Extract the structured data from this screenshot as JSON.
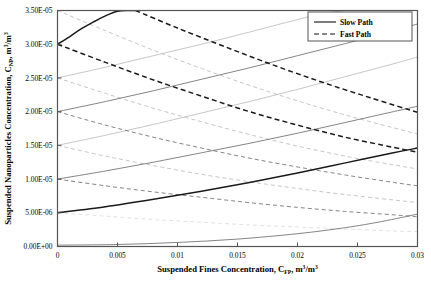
{
  "chart_data": {
    "type": "line",
    "title": "",
    "xlabel": "Suspended Fines Concentration, CFP, m3/m3",
    "ylabel": "Suspended Nanoparticles Concentration, CNP, m3/m3",
    "xlabel_parts": {
      "main": "Suspended Fines Concentration, C",
      "sub1": "FP",
      "mid": ", m",
      "sup1": "3",
      "mid2": "/m",
      "sup2": "3"
    },
    "ylabel_parts": {
      "main": "Suspended Nanoparticles Concentration, C",
      "sub1": "NP",
      "mid": ", m",
      "sup1": "3",
      "mid2": "/m",
      "sup2": "3"
    },
    "xlim": [
      0,
      0.03
    ],
    "ylim": [
      0,
      3.5e-05
    ],
    "grid": false,
    "xticks": [
      0,
      0.005,
      0.01,
      0.015,
      0.02,
      0.025,
      0.03
    ],
    "xtick_labels": [
      "0",
      "0.005",
      "0.01",
      "0.015",
      "0.02",
      "0.025",
      "0.03"
    ],
    "yticks": [
      0,
      5e-06,
      1e-05,
      1.5e-05,
      2e-05,
      2.5e-05,
      3e-05,
      3.5e-05
    ],
    "ytick_labels": [
      "0.00E+00",
      "5.00E-06",
      "1.00E-05",
      "1.50E-05",
      "2.00E-05",
      "2.50E-05",
      "3.00E-05",
      "3.50E-05"
    ],
    "legend": {
      "position": "top-right",
      "entries": [
        {
          "label": "Slow Path",
          "style": "solid"
        },
        {
          "label": "Fast Path",
          "style": "dashed"
        }
      ]
    },
    "colors": {
      "emphasis": "#1a1a1a",
      "mid": "#6e6e6e",
      "light": "#b8b8b8",
      "faint": "#d8d8d8",
      "axis": "#555555"
    },
    "series": [
      {
        "name": "slow-path-1",
        "style": "solid",
        "weight": "emphasis",
        "points": [
          [
            0,
            3e-05
          ],
          [
            0.001,
            3.11e-05
          ],
          [
            0.002,
            3.23e-05
          ],
          [
            0.003,
            3.33e-05
          ],
          [
            0.004,
            3.42e-05
          ],
          [
            0.005,
            3.49e-05
          ],
          [
            0.006,
            3.5e-05
          ],
          [
            0.0065,
            3.5e-05
          ]
        ]
      },
      {
        "name": "fast-path-1",
        "style": "dashed",
        "weight": "emphasis",
        "points": [
          [
            0.0065,
            3.5e-05
          ],
          [
            0.01,
            3.24e-05
          ],
          [
            0.014,
            2.96e-05
          ],
          [
            0.018,
            2.69e-05
          ],
          [
            0.022,
            2.44e-05
          ],
          [
            0.026,
            2.21e-05
          ],
          [
            0.03,
            1.99e-05
          ]
        ]
      },
      {
        "name": "fast-path-2",
        "style": "dashed",
        "weight": "emphasis",
        "points": [
          [
            0,
            3e-05
          ],
          [
            0.004,
            2.73e-05
          ],
          [
            0.008,
            2.47e-05
          ],
          [
            0.012,
            2.23e-05
          ],
          [
            0.016,
            2e-05
          ],
          [
            0.02,
            1.8e-05
          ],
          [
            0.024,
            1.62e-05
          ],
          [
            0.028,
            1.47e-05
          ],
          [
            0.03,
            1.4e-05
          ]
        ]
      },
      {
        "name": "slow-path-2",
        "style": "solid",
        "weight": "mid",
        "points": [
          [
            0,
            2e-05
          ],
          [
            0.004,
            2.15e-05
          ],
          [
            0.008,
            2.31e-05
          ],
          [
            0.012,
            2.48e-05
          ],
          [
            0.016,
            2.65e-05
          ],
          [
            0.02,
            2.83e-05
          ],
          [
            0.024,
            3.01e-05
          ],
          [
            0.028,
            3.2e-05
          ],
          [
            0.03,
            3.3e-05
          ]
        ]
      },
      {
        "name": "fast-path-3",
        "style": "dashed",
        "weight": "mid",
        "points": [
          [
            0,
            2e-05
          ],
          [
            0.004,
            1.8e-05
          ],
          [
            0.008,
            1.62e-05
          ],
          [
            0.012,
            1.46e-05
          ],
          [
            0.016,
            1.31e-05
          ],
          [
            0.02,
            1.18e-05
          ],
          [
            0.024,
            1.06e-05
          ],
          [
            0.028,
            9.5e-06
          ],
          [
            0.03,
            9e-06
          ]
        ]
      },
      {
        "name": "slow-path-3",
        "style": "solid",
        "weight": "emphasis",
        "points": [
          [
            0,
            5e-06
          ],
          [
            0.004,
            5.9e-06
          ],
          [
            0.008,
            7e-06
          ],
          [
            0.012,
            8.2e-06
          ],
          [
            0.016,
            9.5e-06
          ],
          [
            0.02,
            1.09e-05
          ],
          [
            0.024,
            1.24e-05
          ],
          [
            0.028,
            1.39e-05
          ],
          [
            0.03,
            1.46e-05
          ]
        ]
      },
      {
        "name": "fast-path-4",
        "style": "dashed",
        "weight": "mid",
        "points": [
          [
            0,
            1e-05
          ],
          [
            0.004,
            9e-06
          ],
          [
            0.008,
            8.1e-06
          ],
          [
            0.012,
            7.3e-06
          ],
          [
            0.016,
            6.5e-06
          ],
          [
            0.02,
            5.8e-06
          ],
          [
            0.024,
            5.2e-06
          ],
          [
            0.028,
            4.7e-06
          ],
          [
            0.03,
            4.4e-06
          ]
        ]
      },
      {
        "name": "slow-path-4",
        "style": "solid",
        "weight": "mid",
        "points": [
          [
            0,
            1e-05
          ],
          [
            0.004,
            1.12e-05
          ],
          [
            0.008,
            1.25e-05
          ],
          [
            0.012,
            1.39e-05
          ],
          [
            0.016,
            1.53e-05
          ],
          [
            0.02,
            1.68e-05
          ],
          [
            0.024,
            1.84e-05
          ],
          [
            0.028,
            2e-05
          ],
          [
            0.03,
            2.08e-05
          ]
        ]
      },
      {
        "name": "slow-path-5",
        "style": "solid",
        "weight": "light",
        "points": [
          [
            0,
            1.5e-05
          ],
          [
            0.004,
            1.65e-05
          ],
          [
            0.008,
            1.81e-05
          ],
          [
            0.012,
            1.98e-05
          ],
          [
            0.016,
            2.15e-05
          ],
          [
            0.02,
            2.33e-05
          ],
          [
            0.024,
            2.52e-05
          ],
          [
            0.028,
            2.71e-05
          ],
          [
            0.03,
            2.81e-05
          ]
        ]
      },
      {
        "name": "fast-path-5",
        "style": "dashed",
        "weight": "light",
        "points": [
          [
            0,
            1.5e-05
          ],
          [
            0.004,
            1.34e-05
          ],
          [
            0.008,
            1.2e-05
          ],
          [
            0.012,
            1.07e-05
          ],
          [
            0.016,
            9.6e-06
          ],
          [
            0.02,
            8.6e-06
          ],
          [
            0.024,
            7.7e-06
          ],
          [
            0.028,
            6.9e-06
          ],
          [
            0.03,
            6.5e-06
          ]
        ]
      },
      {
        "name": "slow-path-6",
        "style": "solid",
        "weight": "light",
        "points": [
          [
            0,
            2.5e-05
          ],
          [
            0.004,
            2.66e-05
          ],
          [
            0.008,
            2.83e-05
          ],
          [
            0.012,
            3e-05
          ],
          [
            0.016,
            3.18e-05
          ],
          [
            0.019,
            3.32e-05
          ],
          [
            0.022,
            3.45e-05
          ],
          [
            0.024,
            3.5e-05
          ]
        ]
      },
      {
        "name": "fast-path-6",
        "style": "dashed",
        "weight": "light",
        "points": [
          [
            0,
            2.5e-05
          ],
          [
            0.004,
            2.27e-05
          ],
          [
            0.008,
            2.05e-05
          ],
          [
            0.012,
            1.85e-05
          ],
          [
            0.016,
            1.66e-05
          ],
          [
            0.02,
            1.49e-05
          ],
          [
            0.024,
            1.34e-05
          ],
          [
            0.028,
            1.21e-05
          ],
          [
            0.03,
            1.15e-05
          ]
        ]
      },
      {
        "name": "fast-path-7",
        "style": "light-dashed-top",
        "weight": "light",
        "points": [
          [
            0,
            3.5e-05
          ],
          [
            0.004,
            3.2e-05
          ],
          [
            0.008,
            2.91e-05
          ],
          [
            0.012,
            2.64e-05
          ],
          [
            0.016,
            2.39e-05
          ],
          [
            0.02,
            2.16e-05
          ],
          [
            0.024,
            1.95e-05
          ],
          [
            0.028,
            1.76e-05
          ],
          [
            0.03,
            1.67e-05
          ]
        ]
      },
      {
        "name": "fast-path-8",
        "style": "dashed",
        "weight": "faint",
        "points": [
          [
            0,
            5e-06
          ],
          [
            0.004,
            4.5e-06
          ],
          [
            0.008,
            4e-06
          ],
          [
            0.012,
            3.6e-06
          ],
          [
            0.016,
            3.2e-06
          ],
          [
            0.02,
            2.9e-06
          ],
          [
            0.024,
            2.6e-06
          ],
          [
            0.028,
            2.3e-06
          ],
          [
            0.03,
            2.2e-06
          ]
        ]
      },
      {
        "name": "slow-path-7",
        "style": "solid",
        "weight": "mid",
        "points": [
          [
            0,
            2e-07
          ],
          [
            0.005,
            3e-07
          ],
          [
            0.01,
            6e-07
          ],
          [
            0.015,
            1.1e-06
          ],
          [
            0.02,
            1.9e-06
          ],
          [
            0.024,
            2.8e-06
          ],
          [
            0.027,
            3.7e-06
          ],
          [
            0.03,
            4.8e-06
          ]
        ]
      },
      {
        "name": "slow-path-8",
        "style": "solid",
        "weight": "faint",
        "points": [
          [
            0.006,
            3.5e-05
          ],
          [
            0.01,
            3.5e-05
          ]
        ]
      }
    ]
  }
}
